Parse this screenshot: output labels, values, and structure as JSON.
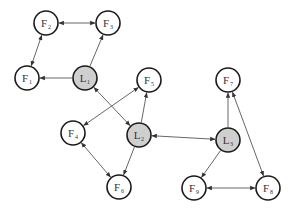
{
  "diagram": {
    "type": "directed-graph",
    "colors": {
      "leader_fill": "#cfcfcf",
      "follower_fill": "#ffffff",
      "stroke": "#1a1a1a",
      "edge": "#555555",
      "background": "#ffffff"
    },
    "node_radius": 12,
    "nodes": [
      {
        "id": "F1",
        "base": "F",
        "sub": "1",
        "kind": "follower",
        "x": 27,
        "y": 78
      },
      {
        "id": "F2",
        "base": "F",
        "sub": "2",
        "kind": "follower",
        "x": 46,
        "y": 23
      },
      {
        "id": "F3",
        "base": "F",
        "sub": "3",
        "kind": "follower",
        "x": 108,
        "y": 23
      },
      {
        "id": "L1",
        "base": "L",
        "sub": "1",
        "kind": "leader",
        "x": 85,
        "y": 78
      },
      {
        "id": "F5",
        "base": "F",
        "sub": "5",
        "kind": "follower",
        "x": 149,
        "y": 80
      },
      {
        "id": "F4",
        "base": "F",
        "sub": "4",
        "kind": "follower",
        "x": 73,
        "y": 133
      },
      {
        "id": "L2",
        "base": "L",
        "sub": "2",
        "kind": "leader",
        "x": 139,
        "y": 135
      },
      {
        "id": "F6",
        "base": "F",
        "sub": "6",
        "kind": "follower",
        "x": 119,
        "y": 187
      },
      {
        "id": "F7",
        "base": "F",
        "sub": "7",
        "kind": "follower",
        "x": 228,
        "y": 80
      },
      {
        "id": "L3",
        "base": "L",
        "sub": "3",
        "kind": "leader",
        "x": 228,
        "y": 140
      },
      {
        "id": "F9",
        "base": "F",
        "sub": "9",
        "kind": "follower",
        "x": 194,
        "y": 188
      },
      {
        "id": "F8",
        "base": "F",
        "sub": "8",
        "kind": "follower",
        "x": 268,
        "y": 188
      }
    ],
    "edges": [
      {
        "from": "F2",
        "to": "F3",
        "bidirectional": true
      },
      {
        "from": "F2",
        "to": "F1",
        "bidirectional": true
      },
      {
        "from": "L1",
        "to": "F1",
        "bidirectional": false
      },
      {
        "from": "L1",
        "to": "F3",
        "bidirectional": false
      },
      {
        "from": "L1",
        "to": "L2",
        "bidirectional": true
      },
      {
        "from": "F4",
        "to": "F5",
        "bidirectional": true
      },
      {
        "from": "L2",
        "to": "F5",
        "bidirectional": false
      },
      {
        "from": "L2",
        "to": "F6",
        "bidirectional": false
      },
      {
        "from": "F4",
        "to": "F6",
        "bidirectional": true
      },
      {
        "from": "L2",
        "to": "L3",
        "bidirectional": true
      },
      {
        "from": "L3",
        "to": "F7",
        "bidirectional": false
      },
      {
        "from": "L3",
        "to": "F9",
        "bidirectional": false
      },
      {
        "from": "F7",
        "to": "F8",
        "bidirectional": true
      },
      {
        "from": "F9",
        "to": "F8",
        "bidirectional": true
      }
    ]
  }
}
